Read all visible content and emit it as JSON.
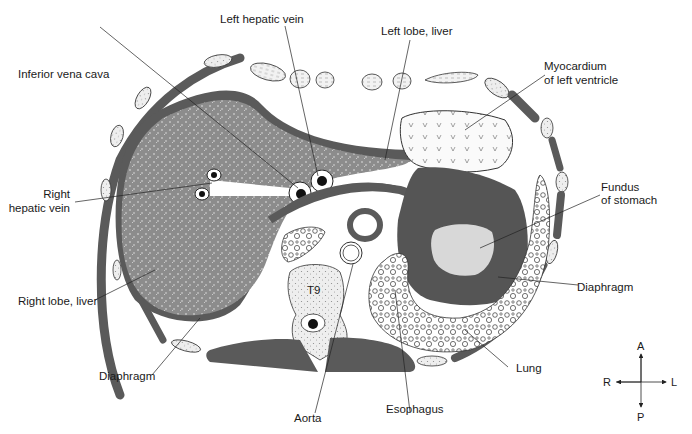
{
  "labels": {
    "left_hepatic_vein": "Left hepatic vein",
    "left_lobe_liver": "Left lobe, liver",
    "inferior_vena_cava": "Inferior vena cava",
    "myocardium_line1": "Myocardium",
    "myocardium_line2": "of left ventricle",
    "right_hepatic_vein_line1": "Right",
    "right_hepatic_vein_line2": "hepatic vein",
    "fundus_line1": "Fundus",
    "fundus_line2": "of stomach",
    "diaphragm_right": "Diaphragm",
    "right_lobe_liver": "Right lobe, liver",
    "diaphragm_left": "Diaphragm",
    "lung": "Lung",
    "aorta": "Aorta",
    "esophagus": "Esophagus",
    "vertebra": "T9"
  },
  "compass": {
    "anterior": "A",
    "posterior": "P",
    "right": "R",
    "left": "L"
  },
  "colors": {
    "muscle": "#5a5a5a",
    "liver": "#8c8c8c",
    "stomach_fundus": "#d8d8d8",
    "bone": "#ececec",
    "outline": "#222222"
  }
}
